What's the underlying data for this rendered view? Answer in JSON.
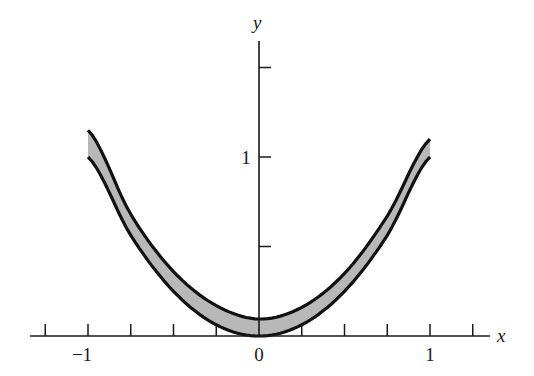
{
  "chart_data": {
    "type": "area",
    "title": "",
    "xlabel": "x",
    "ylabel": "y",
    "xlim": [
      -1.35,
      1.35
    ],
    "ylim": [
      0,
      1.65
    ],
    "grid": false,
    "legend": null,
    "x_ticks": [
      -1.25,
      -1,
      -0.75,
      -0.5,
      -0.25,
      0,
      0.25,
      0.5,
      0.75,
      1,
      1.25
    ],
    "x_tick_labels": [
      {
        "value": -1,
        "label": "−1"
      },
      {
        "value": 0,
        "label": "0"
      },
      {
        "value": 1,
        "label": "1"
      }
    ],
    "y_ticks": [
      0.5,
      1,
      1.5
    ],
    "y_tick_labels": [
      {
        "value": 1,
        "label": "1"
      }
    ],
    "series": [
      {
        "name": "lower boundary",
        "formula": "y = x^2",
        "x": [
          -1,
          -0.75,
          -0.5,
          -0.25,
          0,
          0.25,
          0.5,
          0.75,
          1
        ],
        "values": [
          1,
          0.5625,
          0.25,
          0.0625,
          0,
          0.0625,
          0.25,
          0.5625,
          1
        ]
      },
      {
        "name": "upper boundary",
        "formula": "y ≈ x^2 + 0.1",
        "x": [
          -1,
          -0.75,
          -0.5,
          -0.25,
          0,
          0.25,
          0.5,
          0.75,
          1
        ],
        "values": [
          1.15,
          0.68,
          0.36,
          0.17,
          0.095,
          0.16,
          0.35,
          0.67,
          1.1
        ]
      }
    ],
    "band": {
      "description": "shaded band between lower and upper boundary curves",
      "fill": "#b8b8b8",
      "edge": "#111111"
    }
  },
  "axes": {
    "x_label": "x",
    "y_label": "y"
  }
}
